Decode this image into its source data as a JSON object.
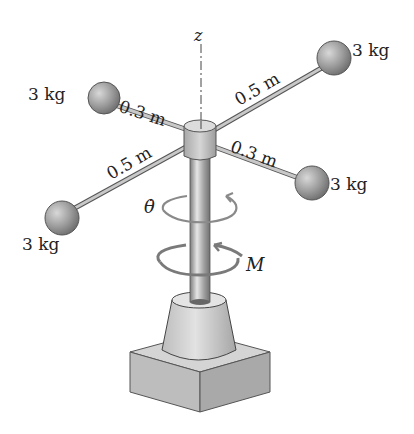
{
  "diagram": {
    "axis_label": "z",
    "masses": [
      {
        "id": "upper-left",
        "label": "3 kg",
        "arm_length": "0.3 m"
      },
      {
        "id": "upper-right",
        "label": "3 kg",
        "arm_length": "0.5 m"
      },
      {
        "id": "lower-left",
        "label": "3 kg",
        "arm_length": "0.5 m"
      },
      {
        "id": "lower-right",
        "label": "3 kg",
        "arm_length": "0.3 m"
      }
    ],
    "angular_velocity_label": "θ̇",
    "moment_label": "M",
    "colors": {
      "sphere": "#9a9a9a",
      "rod": "#b5b5b5",
      "shaft": "#a8a8a8",
      "base": "#c8c8c8",
      "arrow": "#7a7a7a",
      "text": "#222222"
    }
  }
}
